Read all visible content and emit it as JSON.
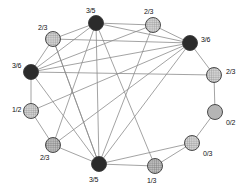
{
  "diagram": {
    "type": "undirected-graph",
    "canvas": {
      "width": 249,
      "height": 192
    },
    "styles": {
      "edge_color": "#8c8c8c",
      "edge_width": 0.8,
      "node_stroke": "#3a3a3a",
      "node_radius": 7.5,
      "fill_black": "#2b2b2b",
      "fill_hatched_light": "#c9c9c9",
      "fill_hatched_dark": "#a8a8a8",
      "fill_solid_gray": "#b5b5b5",
      "label_color": "#111111"
    },
    "nodes": [
      {
        "id": "n0",
        "label": "3/5",
        "fill": "black",
        "cx": 96,
        "cy": 23,
        "label_x": 86,
        "label_y": 7,
        "label_anchor": "above"
      },
      {
        "id": "n1",
        "label": "2/3",
        "fill": "hatched",
        "cx": 153,
        "cy": 25,
        "label_x": 144,
        "label_y": 8,
        "label_anchor": "above"
      },
      {
        "id": "n2",
        "label": "3/6",
        "fill": "black",
        "cx": 190,
        "cy": 43,
        "label_x": 201,
        "label_y": 36,
        "label_anchor": "right"
      },
      {
        "id": "n3",
        "label": "2/3",
        "fill": "hatched",
        "cx": 214,
        "cy": 75,
        "label_x": 226,
        "label_y": 68,
        "label_anchor": "right"
      },
      {
        "id": "n4",
        "label": "0/2",
        "fill": "solid",
        "cx": 215,
        "cy": 112,
        "label_x": 226,
        "label_y": 119,
        "label_anchor": "right"
      },
      {
        "id": "n5",
        "label": "0/3",
        "fill": "hatched",
        "cx": 192,
        "cy": 143,
        "label_x": 203,
        "label_y": 150,
        "label_anchor": "right"
      },
      {
        "id": "n6",
        "label": "1/3",
        "fill": "hatched",
        "cx": 155,
        "cy": 166,
        "label_x": 147,
        "label_y": 177,
        "label_anchor": "below"
      },
      {
        "id": "n7",
        "label": "3/5",
        "fill": "black",
        "cx": 99,
        "cy": 164,
        "label_x": 89,
        "label_y": 176,
        "label_anchor": "below"
      },
      {
        "id": "n8",
        "label": "2/3",
        "fill": "hatched",
        "cx": 53,
        "cy": 145,
        "label_x": 40,
        "label_y": 154,
        "label_anchor": "below-left"
      },
      {
        "id": "n9",
        "label": "1/2",
        "fill": "hatched",
        "cx": 31,
        "cy": 111,
        "label_x": 12,
        "label_y": 106,
        "label_anchor": "left"
      },
      {
        "id": "n10",
        "label": "3/6",
        "fill": "black",
        "cx": 31,
        "cy": 72,
        "label_x": 12,
        "label_y": 62,
        "label_anchor": "left"
      },
      {
        "id": "n11",
        "label": "2/3",
        "fill": "hatched",
        "cx": 53,
        "cy": 39,
        "label_x": 38,
        "label_y": 24,
        "label_anchor": "above-left"
      }
    ],
    "edges": [
      {
        "from": "n0",
        "to": "n1"
      },
      {
        "from": "n1",
        "to": "n2"
      },
      {
        "from": "n2",
        "to": "n3"
      },
      {
        "from": "n3",
        "to": "n4"
      },
      {
        "from": "n4",
        "to": "n5"
      },
      {
        "from": "n5",
        "to": "n6"
      },
      {
        "from": "n6",
        "to": "n7"
      },
      {
        "from": "n7",
        "to": "n8"
      },
      {
        "from": "n8",
        "to": "n9"
      },
      {
        "from": "n9",
        "to": "n10"
      },
      {
        "from": "n10",
        "to": "n11"
      },
      {
        "from": "n11",
        "to": "n0"
      },
      {
        "from": "n0",
        "to": "n2"
      },
      {
        "from": "n0",
        "to": "n7"
      },
      {
        "from": "n0",
        "to": "n10"
      },
      {
        "from": "n1",
        "to": "n10"
      },
      {
        "from": "n2",
        "to": "n10"
      },
      {
        "from": "n2",
        "to": "n11"
      },
      {
        "from": "n2",
        "to": "n7"
      },
      {
        "from": "n2",
        "to": "n8"
      },
      {
        "from": "n2",
        "to": "n9"
      },
      {
        "from": "n3",
        "to": "n10"
      },
      {
        "from": "n5",
        "to": "n7"
      },
      {
        "from": "n6",
        "to": "n0"
      },
      {
        "from": "n7",
        "to": "n11"
      },
      {
        "from": "n8",
        "to": "n0"
      },
      {
        "from": "n11",
        "to": "n7"
      },
      {
        "from": "n10",
        "to": "n7"
      },
      {
        "from": "n1",
        "to": "n7"
      }
    ]
  }
}
